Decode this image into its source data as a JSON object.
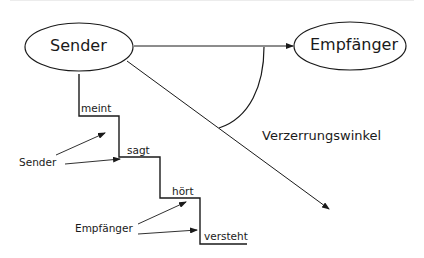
{
  "diagram": {
    "nodes": {
      "sender": "Sender",
      "receiver": "Empfänger"
    },
    "angle_label": "Verzerrungswinkel",
    "steps": [
      "meint",
      "sagt",
      "hört",
      "versteht"
    ],
    "side_labels": {
      "sender": "Sender",
      "receiver": "Empfänger"
    },
    "colors": {
      "stroke": "#1a1a1a",
      "background": "#ffffff"
    }
  }
}
